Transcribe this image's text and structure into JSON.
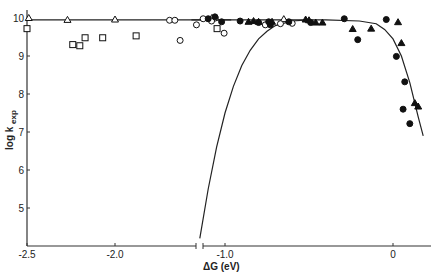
{
  "chart_data": {
    "type": "scatter",
    "title": "",
    "xlabel": "ΔG (eV)",
    "ylabel": "log k_exp",
    "ylabel_main": "log k",
    "ylabel_sub": "exp",
    "xlim": [
      -2.5,
      0.2
    ],
    "ylim": [
      4.0,
      10.3
    ],
    "x_axis_break": {
      "between": [
        -1.35,
        -1.15
      ]
    },
    "x_ticks": [
      {
        "value": -2.5,
        "label": "-2.5"
      },
      {
        "value": -2.0,
        "label": "-2.0"
      },
      {
        "value": -1.0,
        "label": "-1.0"
      },
      {
        "value": 0,
        "label": "0"
      }
    ],
    "y_ticks": [
      {
        "value": 10,
        "label": "10"
      },
      {
        "value": 9,
        "label": "9"
      },
      {
        "value": 8,
        "label": "8"
      },
      {
        "value": 7,
        "label": "7"
      },
      {
        "value": 6,
        "label": "6"
      },
      {
        "value": 5,
        "label": "5"
      }
    ],
    "grid": false,
    "legend": null,
    "series": [
      {
        "name": "open triangles",
        "marker": "triangle-open",
        "points": [
          [
            -2.49,
            10.0
          ],
          [
            -2.27,
            9.95
          ],
          [
            -2.0,
            9.96
          ],
          [
            -1.45,
            10.0
          ],
          [
            -0.65,
            9.97
          ]
        ]
      },
      {
        "name": "open squares",
        "marker": "square-open",
        "points": [
          [
            -2.5,
            9.72
          ],
          [
            -2.24,
            9.3
          ],
          [
            -2.2,
            9.27
          ],
          [
            -2.17,
            9.48
          ],
          [
            -2.07,
            9.48
          ],
          [
            -1.88,
            9.53
          ],
          [
            -1.42,
            9.72
          ]
        ]
      },
      {
        "name": "open circles",
        "marker": "circle-open",
        "points": [
          [
            -1.69,
            9.94
          ],
          [
            -1.66,
            9.94
          ],
          [
            -1.63,
            9.41
          ],
          [
            -1.43,
            10.0
          ],
          [
            -1.38,
            9.6
          ],
          [
            -1.17,
            9.82
          ],
          [
            -1.13,
            9.98
          ],
          [
            -1.08,
            9.92
          ],
          [
            -0.76,
            9.82
          ],
          [
            -0.67,
            9.85
          ],
          [
            -0.6,
            9.86
          ]
        ]
      },
      {
        "name": "filled circles",
        "marker": "circle-filled",
        "points": [
          [
            -1.1,
            9.98
          ],
          [
            -1.06,
            10.03
          ],
          [
            -1.02,
            9.9
          ],
          [
            -0.91,
            9.92
          ],
          [
            -0.8,
            9.88
          ],
          [
            -0.73,
            9.82
          ],
          [
            -0.62,
            9.9
          ],
          [
            -0.49,
            9.88
          ],
          [
            -0.29,
            9.98
          ],
          [
            -0.21,
            9.43
          ],
          [
            -0.04,
            9.96
          ],
          [
            0.02,
            8.99
          ],
          [
            0.07,
            8.32
          ],
          [
            0.06,
            7.6
          ],
          [
            0.1,
            7.22
          ],
          [
            -0.74,
            9.9
          ]
        ]
      },
      {
        "name": "filled triangles",
        "marker": "triangle-filled",
        "points": [
          [
            -0.86,
            9.9
          ],
          [
            -0.83,
            9.92
          ],
          [
            -0.8,
            9.9
          ],
          [
            -0.72,
            9.9
          ],
          [
            -0.52,
            9.96
          ],
          [
            -0.5,
            9.94
          ],
          [
            -0.46,
            9.88
          ],
          [
            -0.42,
            9.88
          ],
          [
            -0.24,
            9.71
          ],
          [
            -0.13,
            9.72
          ],
          [
            0.03,
            9.89
          ],
          [
            0.05,
            9.34
          ],
          [
            0.13,
            7.76
          ],
          [
            0.15,
            7.67
          ]
        ]
      }
    ],
    "curves": [
      {
        "name": "horizontal plateau line (left segment)",
        "points": [
          [
            -2.5,
            9.95
          ],
          [
            -1.34,
            9.95
          ]
        ]
      },
      {
        "name": "upper fitted curve",
        "points": [
          [
            -1.2,
            9.95
          ],
          [
            -0.8,
            9.95
          ],
          [
            -0.4,
            9.95
          ],
          [
            -0.2,
            9.92
          ],
          [
            -0.1,
            9.85
          ],
          [
            -0.05,
            9.7
          ],
          [
            0.0,
            9.45
          ],
          [
            0.05,
            9.0
          ],
          [
            0.1,
            8.3
          ],
          [
            0.15,
            7.4
          ],
          [
            0.18,
            6.9
          ]
        ]
      },
      {
        "name": "lower fitted curve (Marcus inverted)",
        "points": [
          [
            -1.15,
            4.2
          ],
          [
            -1.1,
            5.5
          ],
          [
            -1.05,
            6.6
          ],
          [
            -1.0,
            7.5
          ],
          [
            -0.95,
            8.2
          ],
          [
            -0.9,
            8.75
          ],
          [
            -0.85,
            9.15
          ],
          [
            -0.8,
            9.45
          ],
          [
            -0.75,
            9.65
          ],
          [
            -0.7,
            9.8
          ],
          [
            -0.6,
            9.92
          ],
          [
            -0.5,
            9.95
          ]
        ]
      }
    ]
  }
}
